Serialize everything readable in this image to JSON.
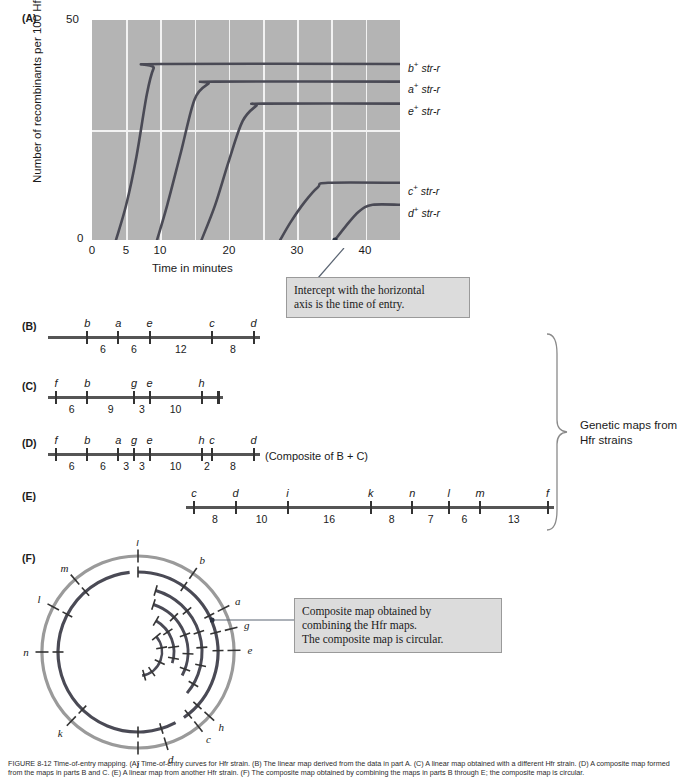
{
  "figure": {
    "panel_letters": {
      "a": "(A)",
      "b": "(B)",
      "c": "(C)",
      "d": "(D)",
      "e": "(E)",
      "f": "(F)"
    },
    "caption": "FIGURE 8-12   Time-of-entry mapping. (A) Time-of-entry curves for Hfr strain. (B) The linear map derived from the data in part A. (C) A linear map obtained with a different Hfr strain. (D) A composite map formed from the maps in parts B and C. (E) A linear map from another Hfr strain. (F) The composite map obtained by combining the maps in parts B through E; the composite map is circular."
  },
  "chart_data": {
    "type": "line",
    "title": "",
    "xlabel": "Time in minutes",
    "ylabel": "Number of recombinants per 100 Hfr cells",
    "xlim": [
      0,
      45
    ],
    "ylim": [
      0,
      50
    ],
    "xticks": [
      0,
      5,
      10,
      20,
      30,
      40
    ],
    "xtick_labels": [
      "0",
      "5",
      "10",
      "20",
      "30",
      "40"
    ],
    "yticks": [
      0,
      50
    ],
    "ytick_labels": [
      "0",
      "50"
    ],
    "grid": true,
    "grid_color": "#f2f2f2",
    "plot_bg": "#b4b4b4",
    "curve_color": "#4a4a55",
    "legend_position": "right-of-curves",
    "series": [
      {
        "name": "b+ str-r",
        "label_html": "b<sup>+</sup> str-r",
        "time_of_entry": 3.5,
        "plateau": 40,
        "points": [
          [
            3.5,
            0
          ],
          [
            5,
            8
          ],
          [
            6.5,
            19
          ],
          [
            8,
            33
          ],
          [
            9,
            39
          ],
          [
            10,
            40
          ],
          [
            45,
            40
          ]
        ]
      },
      {
        "name": "a+ str-r",
        "label_html": "a<sup>+</sup> str-r",
        "time_of_entry": 9.5,
        "plateau": 36,
        "points": [
          [
            9.5,
            0
          ],
          [
            11,
            8
          ],
          [
            13,
            20
          ],
          [
            15,
            32
          ],
          [
            17,
            35.5
          ],
          [
            18,
            36
          ],
          [
            45,
            36
          ]
        ]
      },
      {
        "name": "e+ str-r",
        "label_html": "e<sup>+</sup> str-r",
        "time_of_entry": 16,
        "plateau": 31,
        "points": [
          [
            16,
            0
          ],
          [
            18,
            8
          ],
          [
            20,
            18
          ],
          [
            22,
            27
          ],
          [
            24,
            30.5
          ],
          [
            25,
            31
          ],
          [
            45,
            31
          ]
        ]
      },
      {
        "name": "c+ str-r",
        "label_html": "c<sup>+</sup> str-r",
        "time_of_entry": 27.5,
        "plateau": 13,
        "points": [
          [
            27.5,
            0
          ],
          [
            29,
            4
          ],
          [
            31,
            8.5
          ],
          [
            33,
            12
          ],
          [
            34.5,
            13
          ],
          [
            45,
            13
          ]
        ]
      },
      {
        "name": "d+ str-r",
        "label_html": "d<sup>+</sup> str-r",
        "time_of_entry": 35.5,
        "plateau": 8,
        "points": [
          [
            35.5,
            0
          ],
          [
            37,
            3
          ],
          [
            39,
            6.5
          ],
          [
            41,
            8
          ],
          [
            45,
            8
          ]
        ]
      }
    ],
    "annotation": {
      "text_lines": [
        "Intercept with the horizontal",
        "axis is the time of entry."
      ],
      "points_at_series": "d+ str-r",
      "points_at_value": [
        35.5,
        0
      ]
    }
  },
  "callouts": {
    "intercept": {
      "line1": "Intercept with the horizontal",
      "line2": "axis is the time of entry."
    },
    "composite": {
      "line1": "Composite map obtained by",
      "line2": "combining the Hfr maps.",
      "line3": "The composite map is circular."
    }
  },
  "maps": {
    "b": {
      "letter": "(B)",
      "loci": [
        "b",
        "a",
        "e",
        "c",
        "d"
      ],
      "distances": [
        6,
        6,
        12,
        8
      ],
      "lead_in": 6,
      "trail_out": 0,
      "note": ""
    },
    "c": {
      "letter": "(C)",
      "loci": [
        "f",
        "b",
        "g",
        "e",
        "h"
      ],
      "distances": [
        6,
        9,
        3,
        10
      ],
      "lead_in": 0,
      "trail_out": 3,
      "note": ""
    },
    "d": {
      "letter": "(D)",
      "loci": [
        "f",
        "b",
        "a",
        "g",
        "e",
        "h",
        "c",
        "d"
      ],
      "distances": [
        6,
        6,
        3,
        3,
        10,
        2,
        8
      ],
      "lead_in": 0,
      "trail_out": 0,
      "note": "(Composite of B + C)"
    },
    "e": {
      "letter": "(E)",
      "loci": [
        "c",
        "d",
        "i",
        "k",
        "n",
        "l",
        "m",
        "f"
      ],
      "distances": [
        8,
        10,
        16,
        8,
        7,
        6,
        13
      ],
      "lead_in": 0,
      "trail_out": 0,
      "note": ""
    }
  },
  "brace": {
    "label_line1": "Genetic maps from",
    "label_line2": "Hfr strains"
  },
  "circular_map": {
    "letter": "(F)",
    "outer_ring_color": "#9a9a9a",
    "inner_ring_color": "#4a4a55",
    "outer_labels": [
      {
        "label": "f",
        "angle": -90
      },
      {
        "label": "b",
        "angle": -55
      },
      {
        "label": "a",
        "angle": -27
      },
      {
        "label": "g",
        "angle": -14
      },
      {
        "label": "e",
        "angle": -1
      },
      {
        "label": "h",
        "angle": 42
      },
      {
        "label": "c",
        "angle": 51
      },
      {
        "label": "d",
        "angle": 73
      },
      {
        "label": "i",
        "angle": 90
      },
      {
        "label": "k",
        "angle": 134
      },
      {
        "label": "n",
        "angle": 180
      },
      {
        "label": "l",
        "angle": 208
      },
      {
        "label": "m",
        "angle": 229
      }
    ]
  }
}
